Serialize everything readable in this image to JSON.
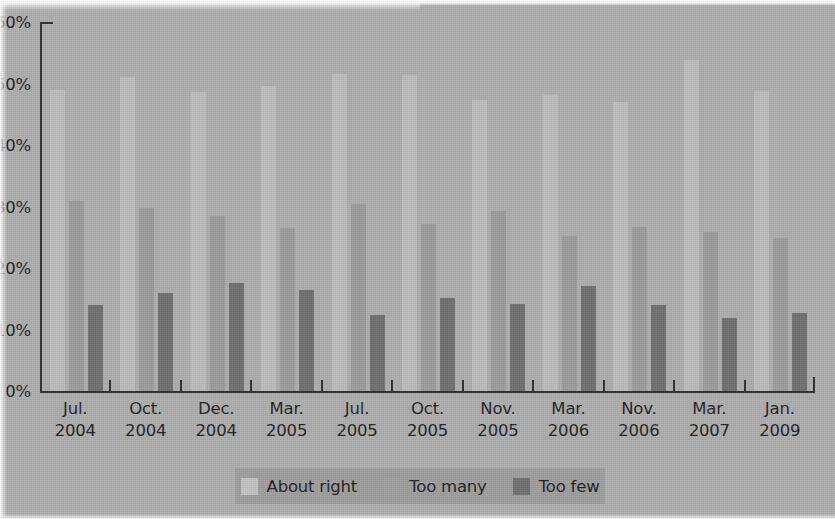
{
  "chart_data": {
    "type": "bar",
    "title": "",
    "subtitle": "",
    "xlabel": "",
    "ylabel": "",
    "ylim": [
      0,
      60
    ],
    "grid": false,
    "legend_position": "bottom",
    "ytick_labels": [
      "0%",
      "10%",
      "20%",
      "30%",
      "40%",
      "50%",
      "60%"
    ],
    "ytick_values": [
      0,
      10,
      20,
      30,
      40,
      50,
      60
    ],
    "categories": [
      "Jul.\n2004",
      "Oct.\n2004",
      "Dec.\n2004",
      "Mar.\n2005",
      "Jul.\n2005",
      "Oct.\n2005",
      "Nov.\n2005",
      "Mar.\n2006",
      "Nov.\n2006",
      "Mar.\n2007",
      "Jan.\n2009"
    ],
    "category_lines": [
      {
        "month": "Jul.",
        "year": "2004"
      },
      {
        "month": "Oct.",
        "year": "2004"
      },
      {
        "month": "Dec.",
        "year": "2004"
      },
      {
        "month": "Mar.",
        "year": "2005"
      },
      {
        "month": "Jul.",
        "year": "2005"
      },
      {
        "month": "Oct.",
        "year": "2005"
      },
      {
        "month": "Nov.",
        "year": "2005"
      },
      {
        "month": "Mar.",
        "year": "2006"
      },
      {
        "month": "Nov.",
        "year": "2006"
      },
      {
        "month": "Mar.",
        "year": "2007"
      },
      {
        "month": "Jan.",
        "year": "2009"
      }
    ],
    "series": [
      {
        "name": "About right",
        "color": "#bcbcbc",
        "values": [
          49.0,
          51.0,
          48.7,
          49.6,
          51.6,
          51.4,
          47.3,
          48.1,
          47.0,
          53.8,
          48.8
        ]
      },
      {
        "name": "Too many",
        "color": "#9b9b9b",
        "values": [
          30.9,
          29.7,
          28.5,
          26.5,
          30.4,
          27.1,
          29.2,
          25.2,
          26.7,
          25.9,
          24.8
        ]
      },
      {
        "name": "Too few",
        "color": "#6f6f6f",
        "values": [
          14.0,
          15.9,
          17.6,
          16.4,
          12.4,
          15.2,
          14.2,
          17.0,
          14.0,
          11.9,
          12.7
        ]
      }
    ]
  },
  "legend": {
    "items": [
      {
        "label": "About right",
        "color": "#c2c2c2"
      },
      {
        "label": "Too many",
        "color": "#9f9f9f"
      },
      {
        "label": "Too few",
        "color": "#6f6f6f"
      }
    ]
  },
  "colors": {
    "background": "#adadad",
    "axis": "#2d2d2d",
    "text": "#1f1f1f",
    "legend_background": "#9d9d9d"
  }
}
